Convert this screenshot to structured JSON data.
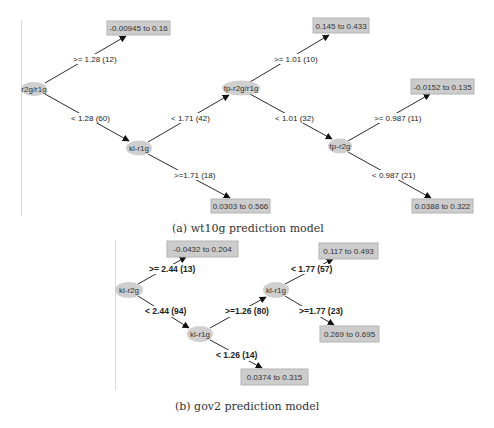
{
  "figure_a": {
    "caption": "(a) wt10g prediction model",
    "nodes": {
      "root": "r2g/r1g",
      "kl_r1g": "kl-r1g",
      "tp_r2g_r1g": "tp-r2g/r1g",
      "tp_r2g": "tp-r2g"
    },
    "leaves": {
      "leaf1": "-0.00945 to 0.16",
      "leaf2": "0.0303 to 0.566",
      "leaf3": "0.145 to 0.433",
      "leaf4": "-0.0152 to 0.135",
      "leaf5": "0.0388 to 0.322"
    },
    "edges": {
      "root_to_leaf1": ">= 1.28 (12)",
      "root_to_kl_r1g": "< 1.28 (60)",
      "kl_r1g_to_tp": "< 1.71 (42)",
      "kl_r1g_to_leaf2": ">=1.71 (18)",
      "tp_to_leaf3": ">= 1.01 (10)",
      "tp_to_tp_r2g": "< 1.01 (32)",
      "tp_r2g_to_leaf4": ">= 0.987 (11)",
      "tp_r2g_to_leaf5": "< 0.987 (21)"
    }
  },
  "figure_b": {
    "caption": "(b) gov2 prediction model",
    "nodes": {
      "root": "kl-r2g",
      "kl_r1g_low": "kl-r1g",
      "kl_r1g_high": "kl-r1g"
    },
    "leaves": {
      "leaf1": "-0.0432 to 0.204",
      "leaf2": "0.0374 to 0.315",
      "leaf3": "0.117 to 0.493",
      "leaf4": "0.269 to 0.695"
    },
    "edges": {
      "root_to_leaf1": ">= 2.44 (13)",
      "root_to_kl_r1g": "< 2.44 (94)",
      "kl_r1g_to_kl_r1g": ">=1.26 (80)",
      "kl_r1g_to_leaf2": "< 1.26 (14)",
      "kl_r1g_high_to_leaf3": "< 1.77 (57)",
      "kl_r1g_high_to_leaf4": ">=1.77 (23)"
    }
  }
}
